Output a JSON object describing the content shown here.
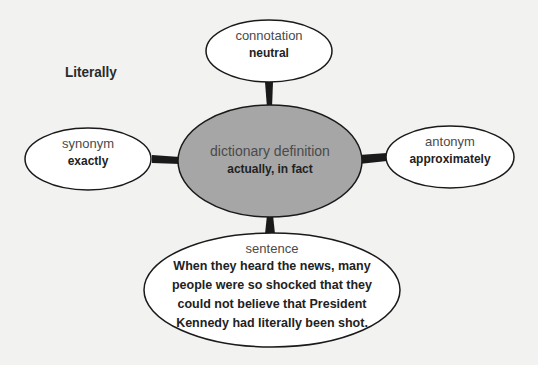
{
  "title": "Literally",
  "nodes": {
    "center": {
      "category": "dictionary definition",
      "value": "actually, in fact"
    },
    "connotation": {
      "category": "connotation",
      "value": "neutral"
    },
    "synonym": {
      "category": "synonym",
      "value": "exactly"
    },
    "antonym": {
      "category": "antonym",
      "value": "approximately"
    },
    "sentence": {
      "category": "sentence",
      "lines": [
        "When they heard the news, many",
        "people were so shocked that they",
        "could not believe that President",
        "Kennedy had literally been shot."
      ]
    }
  },
  "colors": {
    "background": "#f2f2f0",
    "center_fill": "#a6a6a6",
    "node_fill": "#ffffff",
    "stroke": "#1a1a1a"
  }
}
